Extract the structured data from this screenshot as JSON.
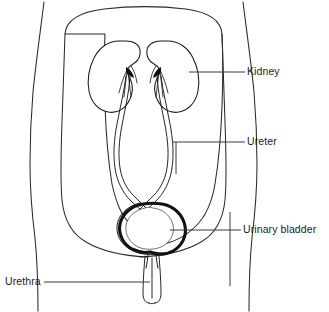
{
  "diagram": {
    "view": "anterior coronal schematic of lower torso",
    "style": "black and white line drawing",
    "background_color": "#ffffff",
    "line_color": "#1a1a1a"
  },
  "labels": {
    "kidney": "Kidney",
    "ureter": "Ureter",
    "urinary_bladder": "Urinary bladder",
    "urethra": "Urethra"
  },
  "structures": [
    {
      "name": "kidney",
      "label": "Kidney",
      "count": 2,
      "label_side": "right",
      "description": "paired bean-shaped organs in the upper abdomen with concave hilum facing midline"
    },
    {
      "name": "ureter",
      "label": "Ureter",
      "count": 2,
      "label_side": "right",
      "description": "paired wavy tubes descending from each kidney hilum to the bladder"
    },
    {
      "name": "urinary-bladder",
      "label": "Urinary bladder",
      "count": 1,
      "label_side": "right",
      "description": "single rounded muscular sac in the pelvis with thick dark wall"
    },
    {
      "name": "urethra",
      "label": "Urethra",
      "count": 1,
      "label_side": "left",
      "description": "single narrow tube descending from the bladder neck"
    }
  ],
  "leader_lines": [
    {
      "name": "kidney-leader",
      "from": "Kidney label",
      "to": "right kidney",
      "orientation": "horizontal",
      "has_tick": false
    },
    {
      "name": "ureter-leader",
      "from": "Ureter label",
      "to": "right ureter",
      "orientation": "horizontal",
      "has_tick": true
    },
    {
      "name": "bladder-leader",
      "from": "Urinary bladder label",
      "to": "urinary bladder",
      "orientation": "horizontal",
      "has_tick": true
    },
    {
      "name": "urethra-leader",
      "from": "Urethra label",
      "to": "urethra",
      "orientation": "horizontal",
      "has_tick": false
    }
  ]
}
